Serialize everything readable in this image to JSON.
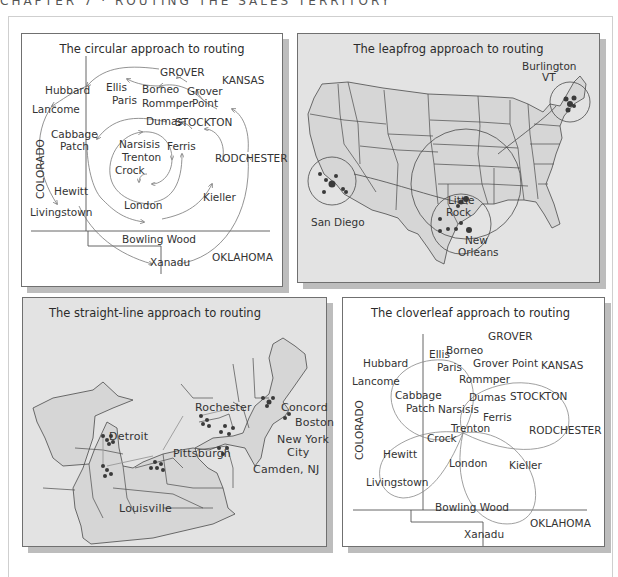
{
  "header": {
    "text": "CHAPTER 7 · ROUTING THE SALES TERRITORY"
  },
  "panels": {
    "circular": {
      "title": "The circular approach to routing",
      "regions": {
        "colorado": "COLORADO",
        "kansas": "KANSAS",
        "oklahoma": "OKLAHOMA"
      },
      "cities": {
        "grover": "GROVER",
        "hubbard": "Hubbard",
        "ellis": "Ellis",
        "borneo": "Borneo",
        "grover_point_1": "Grover",
        "grover_point_2": "Point",
        "lancome": "Lancome",
        "paris": "Paris",
        "rommper": "Rommper",
        "dumas": "Dumas",
        "stockton": "STOCKTON",
        "cabbage_1": "Cabbage",
        "cabbage_2": "Patch",
        "narsisis": "Narsisis",
        "ferris": "Ferris",
        "trenton": "Trenton",
        "crock": "Crock",
        "rodchester": "RODCHESTER",
        "hewitt": "Hewitt",
        "kieller": "Kieller",
        "london": "London",
        "livingstown": "Livingstown",
        "bowling_wood": "Bowling Wood",
        "xanadu": "Xanadu"
      }
    },
    "leapfrog": {
      "title": "The leapfrog approach to routing",
      "cities": {
        "burlington_1": "Burlington",
        "burlington_2": "VT",
        "little_rock_1": "Little",
        "little_rock_2": "Rock",
        "san_diego": "San Diego",
        "new_orleans_1": "New",
        "new_orleans_2": "Orleans"
      }
    },
    "straight_line": {
      "title": "The straight-line approach to routing",
      "cities": {
        "rochester": "Rochester",
        "concord": "Concord",
        "boston": "Boston",
        "detroit": "Detroit",
        "new_york_1": "New York",
        "new_york_2": "City",
        "pittsburgh": "Pittsburgh",
        "camden": "Camden, NJ",
        "louisville": "Louisville"
      }
    },
    "cloverleaf": {
      "title": "The cloverleaf approach to routing",
      "regions": {
        "colorado": "COLORADO",
        "kansas": "KANSAS",
        "oklahoma": "OKLAHOMA"
      },
      "cities": {
        "grover": "GROVER",
        "hubbard": "Hubbard",
        "ellis": "Ellis",
        "borneo": "Borneo",
        "grover_point": "Grover Point",
        "lancome": "Lancome",
        "paris": "Paris",
        "rommper": "Rommper",
        "cabbage_1": "Cabbage",
        "cabbage_2": "Patch",
        "dumas": "Dumas",
        "stockton": "STOCKTON",
        "narsisis": "Narsisis",
        "ferris": "Ferris",
        "trenton": "Trenton",
        "rodchester": "RODCHESTER",
        "crock": "Crock",
        "hewitt": "Hewitt",
        "london": "London",
        "kieller": "Kieller",
        "livingstown": "Livingstown",
        "bowling_wood": "Bowling Wood",
        "xanadu": "Xanadu"
      }
    }
  },
  "colors": {
    "map_fill": "#d6d6d6",
    "panel_gray": "#e3e3e3",
    "shadow": "#bdbdbd",
    "line": "#555555",
    "dot": "#3a3a3a"
  }
}
